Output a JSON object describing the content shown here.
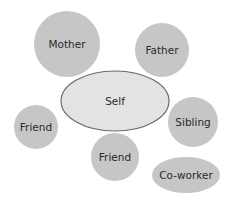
{
  "diagram": {
    "type": "social-network-bubble-diagram",
    "colors": {
      "node_fill": "#c6c6c6",
      "center_fill": "#e3e3e3",
      "center_stroke": "#6a6a6a",
      "text": "#2a2a2a",
      "background": "#ffffff"
    },
    "center": {
      "label": "Self",
      "shape": "ellipse",
      "cx": 115,
      "cy": 101,
      "rx": 54,
      "ry": 30
    },
    "nodes": [
      {
        "id": "mother",
        "label": "Mother",
        "shape": "circle",
        "cx": 67,
        "cy": 44,
        "r": 33
      },
      {
        "id": "father",
        "label": "Father",
        "shape": "circle",
        "cx": 162,
        "cy": 50,
        "r": 27
      },
      {
        "id": "friend-left",
        "label": "Friend",
        "shape": "circle",
        "cx": 36,
        "cy": 127,
        "r": 22
      },
      {
        "id": "sibling",
        "label": "Sibling",
        "shape": "circle",
        "cx": 193,
        "cy": 122,
        "r": 25
      },
      {
        "id": "friend-bottom",
        "label": "Friend",
        "shape": "circle",
        "cx": 115,
        "cy": 157,
        "r": 24
      },
      {
        "id": "co-worker",
        "label": "Co-worker",
        "shape": "ellipse",
        "cx": 186,
        "cy": 175,
        "rx": 34,
        "ry": 18
      }
    ]
  }
}
